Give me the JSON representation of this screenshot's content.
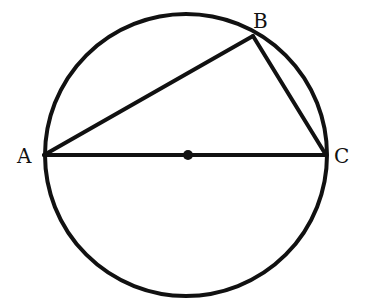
{
  "diagram": {
    "type": "circle-inscribed-triangle",
    "circle": {
      "cx": 186,
      "cy": 155,
      "r": 141
    },
    "center_point": {
      "x": 186,
      "y": 155
    },
    "points": {
      "A": {
        "label": "A",
        "x": 44,
        "y": 155
      },
      "B": {
        "label": "B",
        "x": 253,
        "y": 36
      },
      "C": {
        "label": "C",
        "x": 326,
        "y": 155
      }
    },
    "segments": [
      [
        "A",
        "B"
      ],
      [
        "B",
        "C"
      ],
      [
        "A",
        "C"
      ]
    ],
    "stroke_color": "#111111"
  }
}
